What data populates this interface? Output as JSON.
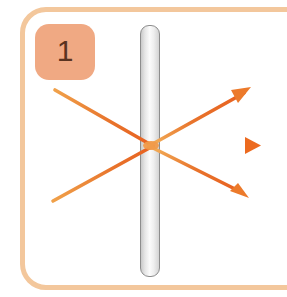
{
  "figure": {
    "panel_number": "1",
    "caption": "",
    "frame_color": "#f3c79c",
    "badge_color": "#f0a983",
    "badge_text_color": "#5a3320",
    "barrier_label": "",
    "barrier_border_color": "#8d8d8d",
    "barrier_fill_light": "#fbfbfb",
    "barrier_fill_dark": "#c9c9c9",
    "ray_color": "#e8742c",
    "ray_color_light": "#f5a94f"
  },
  "diagram": {
    "type": "ray-diagram",
    "convergence_point": {
      "x": 151,
      "y": 145
    },
    "barrier": {
      "x": 140,
      "y": 25,
      "width": 20,
      "height": 252
    },
    "incoming_rays": [
      {
        "name": "upper-incident-ray",
        "x1": 55,
        "y1": 90,
        "x2": 151,
        "y2": 145
      },
      {
        "name": "horizontal-incident-ray",
        "x1": 42,
        "y1": 145,
        "x2": 151,
        "y2": 145
      },
      {
        "name": "lower-incident-ray",
        "x1": 53,
        "y1": 201,
        "x2": 151,
        "y2": 145
      }
    ],
    "outgoing_rays": [
      {
        "name": "upper-outgoing-ray",
        "x1": 151,
        "y1": 145,
        "x2": 248,
        "y2": 90,
        "arrow": true
      },
      {
        "name": "horizontal-outgoing-ray",
        "x1": 151,
        "y1": 145,
        "x2": 258,
        "y2": 145,
        "arrow": true
      },
      {
        "name": "lower-outgoing-ray",
        "x1": 151,
        "y1": 145,
        "x2": 246,
        "y2": 196,
        "arrow": true
      }
    ],
    "arrow_count": 3
  }
}
